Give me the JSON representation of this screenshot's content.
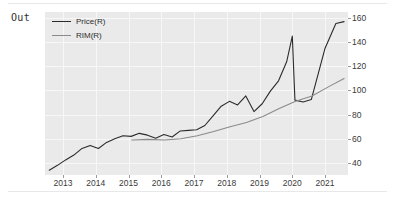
{
  "notebook": {
    "out_prompt": "Out"
  },
  "chart_data": {
    "type": "line",
    "title": "",
    "xlabel": "",
    "ylabel": "",
    "xlim": [
      2012.45,
      2021.7
    ],
    "ylim": [
      30,
      165
    ],
    "grid": true,
    "legend_position": "upper left",
    "plot_background": "#eaeaea",
    "grid_color": "#f7f7f7",
    "yaxis_side": "right",
    "yticks": [
      40,
      60,
      80,
      100,
      120,
      140,
      160
    ],
    "xticks": [
      2013,
      2014,
      2015,
      2016,
      2017,
      2018,
      2019,
      2020,
      2021
    ],
    "xticklabels": [
      "2013",
      "2014",
      "2015",
      "2016",
      "2017",
      "2018",
      "2019",
      "2020",
      "2021"
    ],
    "yticklabels": [
      "40",
      "60",
      "80",
      "100",
      "120",
      "140",
      "160"
    ],
    "series": [
      {
        "name": "Price(R)",
        "color": "#2b2b2b",
        "x": [
          2012.58,
          2012.83,
          2013.08,
          2013.33,
          2013.58,
          2013.83,
          2014.08,
          2014.33,
          2014.58,
          2014.83,
          2015.08,
          2015.33,
          2015.58,
          2015.83,
          2016.08,
          2016.33,
          2016.58,
          2016.83,
          2017.08,
          2017.33,
          2017.58,
          2017.83,
          2018.08,
          2018.33,
          2018.58,
          2018.83,
          2019.08,
          2019.33,
          2019.58,
          2019.83,
          2020.0,
          2020.08,
          2020.33,
          2020.58,
          2021.0,
          2021.33,
          2021.58
        ],
        "y": [
          34.0,
          38.0,
          42.5,
          46.5,
          52.0,
          54.5,
          52.0,
          57.0,
          60.0,
          62.5,
          62.0,
          64.5,
          63.0,
          60.5,
          63.5,
          61.5,
          66.5,
          67.0,
          67.5,
          71.0,
          79.0,
          87.0,
          91.0,
          88.0,
          95.5,
          82.5,
          89.0,
          99.5,
          108.0,
          124.0,
          145.0,
          92.0,
          90.5,
          92.5,
          135.0,
          155.5,
          157.0
        ]
      },
      {
        "name": "RIM(R)",
        "color": "#8a8a8a",
        "x": [
          2015.1,
          2015.6,
          2016.1,
          2016.6,
          2017.1,
          2017.6,
          2018.1,
          2018.6,
          2019.1,
          2019.6,
          2020.1,
          2020.6,
          2021.1,
          2021.58
        ],
        "y": [
          59.0,
          59.5,
          59.0,
          60.0,
          62.5,
          66.0,
          70.0,
          73.5,
          78.5,
          85.0,
          91.0,
          95.5,
          103.0,
          110.0
        ]
      }
    ]
  }
}
